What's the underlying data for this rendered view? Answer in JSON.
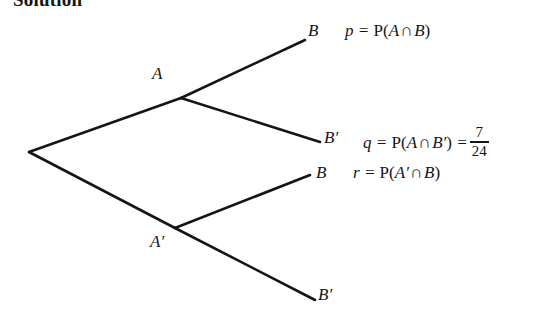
{
  "document": {
    "heading": "Solution",
    "background_color": "#ffffff",
    "ink_color": "#151515"
  },
  "tree": {
    "type": "probability-tree-diagram",
    "root": {
      "x": 29,
      "y": 152
    },
    "nodes": [
      {
        "id": "A",
        "label": "A",
        "label_x": 152,
        "label_y": 64,
        "point_x": 181,
        "point_y": 98
      },
      {
        "id": "Ap",
        "label": "A′",
        "label_x": 150,
        "label_y": 232,
        "point_x": 175,
        "point_y": 228
      }
    ],
    "branches": [
      {
        "from": "root",
        "to": "A",
        "x1": 29,
        "y1": 152,
        "x2": 181,
        "y2": 98
      },
      {
        "from": "root",
        "to": "Ap",
        "x1": 29,
        "y1": 152,
        "x2": 175,
        "y2": 228
      },
      {
        "from": "A",
        "to": "B1",
        "x1": 181,
        "y1": 98,
        "x2": 305,
        "y2": 40
      },
      {
        "from": "A",
        "to": "B2",
        "x1": 181,
        "y1": 98,
        "x2": 320,
        "y2": 142
      },
      {
        "from": "Ap",
        "to": "B3",
        "x1": 175,
        "y1": 228,
        "x2": 310,
        "y2": 175
      },
      {
        "from": "Ap",
        "to": "B4",
        "x1": 175,
        "y1": 228,
        "x2": 315,
        "y2": 300
      }
    ],
    "leaf_labels": [
      {
        "id": "B1",
        "text": "B"
      },
      {
        "id": "B2",
        "text": "B′"
      },
      {
        "id": "B3",
        "text": "B"
      },
      {
        "id": "B4",
        "text": "B′"
      }
    ]
  },
  "equations": {
    "p": {
      "variable": "p",
      "equals": "=",
      "prob_symbol": "P",
      "open": "(",
      "left_event": "A",
      "intersection": "∩",
      "right_event": "B",
      "close": ")"
    },
    "q": {
      "variable": "q",
      "equals": "=",
      "prob_symbol": "P",
      "open": "(",
      "left_event": "A",
      "intersection": "∩",
      "right_event": "B′",
      "close": ")",
      "equals2": "=",
      "value_numerator": "7",
      "value_denominator": "24"
    },
    "r": {
      "variable": "r",
      "equals": "=",
      "prob_symbol": "P",
      "open": "(",
      "left_event": "A′",
      "intersection": "∩",
      "right_event": "B",
      "close": ")"
    }
  }
}
